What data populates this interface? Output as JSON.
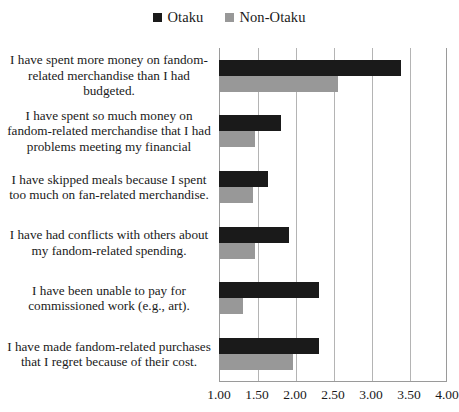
{
  "chart_data": {
    "type": "bar",
    "orientation": "horizontal",
    "title": "",
    "xlabel": "",
    "ylabel": "",
    "xlim": [
      1.0,
      4.0
    ],
    "grid": true,
    "legend_position": "top-center",
    "tick_labels": [
      "1.00",
      "1.50",
      "2.00",
      "2.50",
      "3.00",
      "3.50",
      "4.00"
    ],
    "tick_values": [
      1.0,
      1.5,
      2.0,
      2.5,
      3.0,
      3.5,
      4.0
    ],
    "categories": [
      "I have spent more money on fandom-related merchandise than I had budgeted.",
      "I have spent so much money on fandom-related merchandise that I had problems meeting my financial",
      "I have skipped meals because I spent too much on fan-related merchandise.",
      "I have had conflicts with others about my fandom-related spending.",
      "I have been unable to pay for commissioned work (e.g., art).",
      "I have made fandom-related purchases that I regret because of their cost."
    ],
    "series": [
      {
        "name": "Otaku",
        "color": "#1a1a1a",
        "values": [
          3.4,
          1.82,
          1.65,
          1.92,
          2.32,
          2.32
        ]
      },
      {
        "name": "Non-Otaku",
        "color": "#989898",
        "values": [
          2.57,
          1.48,
          1.45,
          1.47,
          1.31,
          1.98
        ]
      }
    ]
  },
  "legend": {
    "items": [
      {
        "label": "Otaku",
        "color": "#1a1a1a"
      },
      {
        "label": "Non-Otaku",
        "color": "#989898"
      }
    ]
  }
}
